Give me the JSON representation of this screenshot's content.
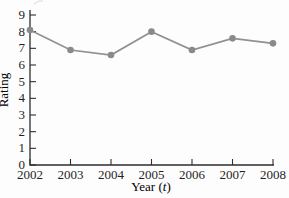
{
  "figure": {
    "background": "#fdfdfd",
    "axis_color": "#2e2e2e",
    "text_color": "#1f1f1f",
    "artifact_color": "#b8b8b8"
  },
  "chart_data": {
    "type": "line",
    "title": "",
    "xlabel": "Year (t)",
    "xlabel_parts": {
      "pre": "Year (",
      "var": "t",
      "post": ")"
    },
    "ylabel": "Rating",
    "x": [
      2002,
      2003,
      2004,
      2005,
      2006,
      2007,
      2008
    ],
    "values": [
      8.1,
      6.9,
      6.6,
      8.0,
      6.9,
      7.6,
      7.3
    ],
    "xlim": [
      2002,
      2008
    ],
    "ylim": [
      0,
      9
    ],
    "xticks": [
      2002,
      2003,
      2004,
      2005,
      2006,
      2007,
      2008
    ],
    "yticks": [
      0,
      1,
      2,
      3,
      4,
      5,
      6,
      7,
      8,
      9
    ],
    "grid": false,
    "legend": "none",
    "line_color": "#909090",
    "marker_color": "#8a8a8a",
    "marker": "circle"
  }
}
